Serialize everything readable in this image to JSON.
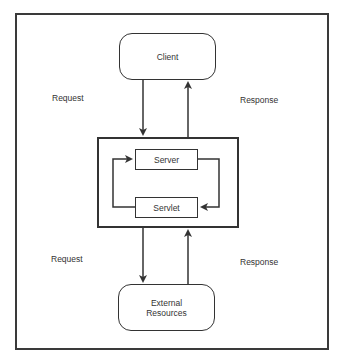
{
  "diagram": {
    "nodes": {
      "client": "Client",
      "server": "Server",
      "servlet": "Servlet",
      "external_resources_line1": "External",
      "external_resources_line2": "Resources"
    },
    "edge_labels": {
      "top_request": "Request",
      "top_response": "Response",
      "bottom_request": "Request",
      "bottom_response": "Response"
    },
    "edges": [
      {
        "from": "Client",
        "to": "Server container",
        "label": "Request"
      },
      {
        "from": "Server container",
        "to": "Client",
        "label": "Response"
      },
      {
        "from": "Server",
        "to": "Servlet",
        "label": ""
      },
      {
        "from": "Servlet",
        "to": "Server",
        "label": ""
      },
      {
        "from": "Server container",
        "to": "External Resources",
        "label": "Request"
      },
      {
        "from": "External Resources",
        "to": "Server container",
        "label": "Response"
      }
    ],
    "colors": {
      "stroke": "#333333",
      "background": "#ffffff"
    }
  }
}
